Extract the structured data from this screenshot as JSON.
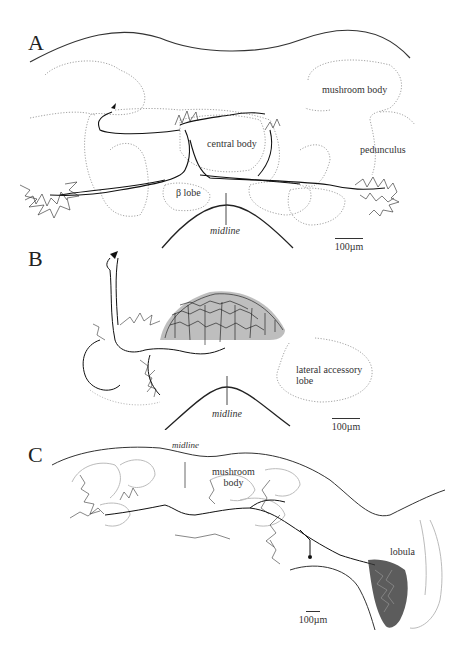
{
  "figure": {
    "panels": [
      {
        "id": "A",
        "letter": "A",
        "labels": {
          "mushroom_body": "mushroom body",
          "central_body": "central body",
          "pedunculus": "pedunculus",
          "beta_lobe": "β lobe",
          "midline": "midline"
        },
        "scale_bar": "100µm"
      },
      {
        "id": "B",
        "letter": "B",
        "labels": {
          "lateral_accessory_lobe_line1": "lateral accessory",
          "lateral_accessory_lobe_line2": "lobe",
          "midline": "midline"
        },
        "scale_bar": "100µm"
      },
      {
        "id": "C",
        "letter": "C",
        "labels": {
          "midline": "midline",
          "mushroom_body_line1": "mushroom",
          "mushroom_body_line2": "body",
          "lobula": "lobula"
        },
        "scale_bar": "100µm"
      }
    ]
  }
}
